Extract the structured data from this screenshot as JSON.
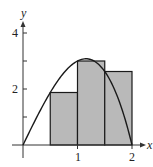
{
  "chart_data": {
    "type": "area",
    "title": "",
    "xlabel": "x",
    "ylabel": "y",
    "function": "f(x) = x(4 - x^2)",
    "xlim": [
      0,
      2
    ],
    "ylim": [
      0,
      4
    ],
    "x_ticks": [
      1,
      2
    ],
    "x_tick_labels": [
      "1",
      "2"
    ],
    "y_ticks": [
      1,
      2,
      3,
      4
    ],
    "y_tick_labels": [
      "",
      "2",
      "",
      "4"
    ],
    "grid": false,
    "legend": null,
    "curve": {
      "x": [
        0,
        0.25,
        0.5,
        0.75,
        1.0,
        1.155,
        1.25,
        1.5,
        1.75,
        2.0
      ],
      "y": [
        0,
        0.984,
        1.875,
        2.578,
        3.0,
        3.079,
        3.047,
        2.625,
        1.641,
        0
      ]
    },
    "rectangles": [
      {
        "x_start": 0.5,
        "x_end": 1.0,
        "height": 1.875
      },
      {
        "x_start": 1.0,
        "x_end": 1.5,
        "height": 3.0
      },
      {
        "x_start": 1.5,
        "x_end": 2.0,
        "height": 2.625
      }
    ],
    "colors": {
      "rect_fill": "#b9b9b9",
      "stroke": "#1a1a1a"
    }
  },
  "labels": {
    "x_axis": "x",
    "y_axis": "y",
    "x_tick_1": "1",
    "x_tick_2": "2",
    "y_tick_2": "2",
    "y_tick_4": "4"
  }
}
